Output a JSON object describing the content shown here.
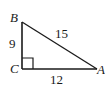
{
  "diagram": {
    "type": "right-triangle",
    "vertices": {
      "B": {
        "label": "B"
      },
      "C": {
        "label": "C"
      },
      "A": {
        "label": "A"
      }
    },
    "sides": {
      "BC": {
        "label": "9"
      },
      "BA": {
        "label": "15"
      },
      "CA": {
        "label": "12"
      }
    },
    "right_angle_at": "C",
    "stroke_color": "#1a1a1a"
  }
}
